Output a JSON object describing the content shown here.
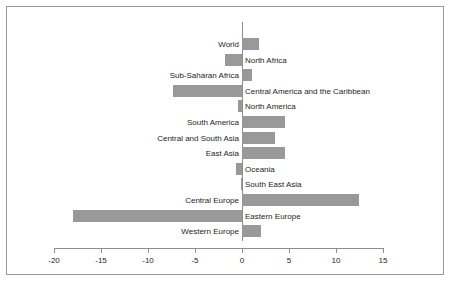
{
  "chart_data": {
    "type": "bar",
    "orientation": "horizontal",
    "title": "",
    "subtitle": "",
    "xlabel": "",
    "ylabel": "",
    "xlim": [
      -20,
      15
    ],
    "xticks": [
      -20,
      -15,
      -10,
      -5,
      0,
      5,
      10,
      15
    ],
    "xtick_labels": [
      "-20",
      "-15",
      "-10",
      "-5",
      "0",
      "5",
      "10",
      "15"
    ],
    "grid": false,
    "legend": null,
    "bar_color": "#999999",
    "axis_color": "#8d8d8d",
    "text_color": "#231f20",
    "categories": [
      "World",
      "North Africa",
      "Sub-Saharan Africa",
      "Central America and the Caribbean",
      "North America",
      "South America",
      "Central and South Asia",
      "East Asia",
      "Oceania",
      "South East Asia",
      "Central Europe",
      "Eastern Europe",
      "Western Europe"
    ],
    "values": [
      1.8,
      -1.8,
      1.1,
      -7.3,
      -0.4,
      4.6,
      3.5,
      4.6,
      -0.6,
      -0.1,
      12.4,
      -18.0,
      2.0
    ]
  }
}
